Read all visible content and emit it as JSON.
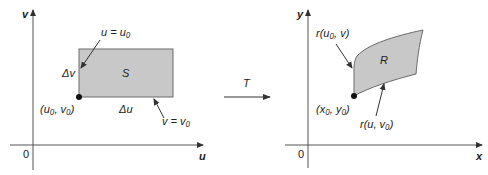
{
  "left_panel": {
    "axis_x_label": "u",
    "axis_y_label": "v",
    "origin_label": "0",
    "region_label": "S",
    "point_label": "(u₀, v₀)",
    "delta_u_label": "Δu",
    "delta_v_label": "Δv",
    "edge_u_label": "u = u₀",
    "edge_v_label": "v = v₀"
  },
  "transform": {
    "label": "T"
  },
  "right_panel": {
    "axis_x_label": "x",
    "axis_y_label": "y",
    "origin_label": "0",
    "region_label": "R",
    "point_label": "(x₀, y₀)",
    "curve_v_label": "r(u₀, v)",
    "curve_u_label": "r(u, v₀)"
  },
  "colors": {
    "region_fill": "#c8c8c8",
    "region_stroke": "#6a6a6a",
    "axis": "#555555",
    "text": "#222222"
  }
}
